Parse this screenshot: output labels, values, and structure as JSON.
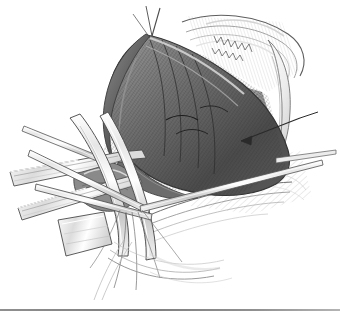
{
  "figure": {
    "kind": "surgical-line-illustration",
    "medium": "pen-and-ink stipple and cross-hatch, grayscale",
    "background_color": "#ffffff",
    "ink_color": "#1d1d1d",
    "midtone_color": "#7d7d7d",
    "highlight_color": "#f2f2f2",
    "caption": "",
    "title": ""
  },
  "rule": {
    "color": "#8f8f8f",
    "visible": true
  },
  "annotations": {
    "leader_arrow": {
      "label": "",
      "direction": "points-left-into-oval-structure",
      "color": "#2a2a2a"
    }
  },
  "elements": [
    {
      "name": "tissue-flap-dark",
      "tone": "dark",
      "note": "large retracted flap upper centre"
    },
    {
      "name": "muscle-bed-hatched",
      "tone": "mid",
      "note": "hatched exposed muscle bed"
    },
    {
      "name": "oval-structure",
      "tone": "mid",
      "note": "circular structure at right of field"
    },
    {
      "name": "retractor-blade-left",
      "tone": "light",
      "note": "broad metal retractor, lower left"
    },
    {
      "name": "retractor-blade-lower",
      "tone": "light",
      "note": "second retractor blade"
    },
    {
      "name": "forceps-shaft",
      "tone": "light",
      "note": "slender forceps crossing field"
    },
    {
      "name": "suture-strands",
      "tone": "light",
      "note": "fine thread strands lower centre"
    },
    {
      "name": "skin-margin-arc",
      "tone": "light",
      "note": "hatched skin edge upper right"
    },
    {
      "name": "shadow-hatching",
      "tone": "light",
      "note": "drop shadow hatching lower right"
    }
  ]
}
